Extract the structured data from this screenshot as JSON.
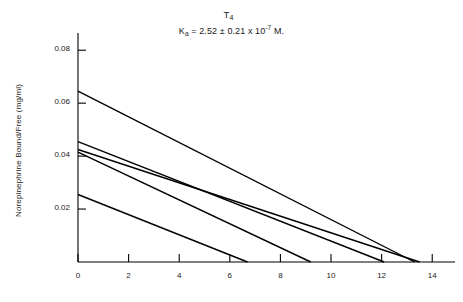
{
  "chart_data": {
    "type": "line",
    "title": "T4",
    "title_base": "T",
    "title_sub": "4",
    "subtitle": "Ka = 2.52 ± 0.21 x 10-7 M.",
    "subtitle_parts": {
      "k": "K",
      "k_sub": "a",
      "equals": " = 2.52 ± 0.21 x 10",
      "exp": "-7",
      "unit": " M."
    },
    "xlabel": "",
    "ylabel": "Norepinephrine Bound/Free (mg/ml)",
    "xlim": [
      0,
      14.9
    ],
    "ylim": [
      0,
      0.0865
    ],
    "grid": false,
    "legend": "none",
    "xticks": [
      0,
      2,
      4,
      6,
      8,
      10,
      12,
      14
    ],
    "xtick_labels": [
      "0",
      "2",
      "4",
      "6",
      "8",
      "10",
      "12",
      "14"
    ],
    "yticks": [
      0.02,
      0.04,
      0.06,
      0.08
    ],
    "ytick_labels": [
      "0.02",
      "0.04",
      "0.06",
      "0.08"
    ],
    "series": [
      {
        "name": "line-1",
        "x": [
          0,
          13.3
        ],
        "y": [
          0.0645,
          0
        ]
      },
      {
        "name": "line-2",
        "x": [
          0,
          12.1
        ],
        "y": [
          0.0455,
          0
        ]
      },
      {
        "name": "line-3",
        "x": [
          0,
          13.5
        ],
        "y": [
          0.0425,
          0
        ]
      },
      {
        "name": "line-4",
        "x": [
          0,
          9.2
        ],
        "y": [
          0.0415,
          0
        ]
      },
      {
        "name": "line-5",
        "x": [
          0,
          6.7
        ],
        "y": [
          0.0255,
          0
        ]
      }
    ],
    "line_color": "#000000",
    "axis_color": "#000000",
    "background": "#ffffff"
  }
}
